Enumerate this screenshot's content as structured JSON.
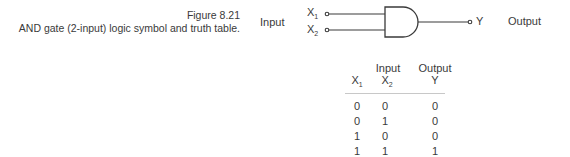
{
  "caption": {
    "figure": "Figure 8.21",
    "text": "AND gate (2-input) logic symbol and truth table."
  },
  "symbol": {
    "input_label": "Input",
    "output_label": "Output",
    "inputs": [
      {
        "name": "X",
        "sub": "1"
      },
      {
        "name": "X",
        "sub": "2"
      }
    ],
    "output": "Y"
  },
  "truth_table": {
    "group_headers": [
      "Input",
      "Output"
    ],
    "columns": [
      {
        "name": "X",
        "sub": "1"
      },
      {
        "name": "X",
        "sub": "2"
      },
      {
        "name": "Y",
        "sub": ""
      }
    ],
    "rows": [
      [
        "0",
        "0",
        "0"
      ],
      [
        "0",
        "1",
        "0"
      ],
      [
        "1",
        "0",
        "0"
      ],
      [
        "1",
        "1",
        "1"
      ]
    ]
  }
}
